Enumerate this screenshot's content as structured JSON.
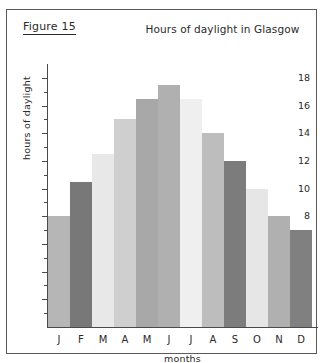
{
  "figure": {
    "label": "Figure 15"
  },
  "chart_data": {
    "type": "bar",
    "title": "Hours of daylight in Glasgow",
    "xlabel": "months",
    "ylabel": "hours of daylight",
    "categories": [
      "J",
      "F",
      "M",
      "A",
      "M",
      "J",
      "J",
      "A",
      "S",
      "O",
      "N",
      "D"
    ],
    "values": [
      8,
      10.5,
      12.5,
      15,
      16.5,
      17.5,
      16.5,
      14,
      12,
      10,
      8,
      7
    ],
    "bar_colors": [
      "#b6b6b6",
      "#787878",
      "#e8e8e8",
      "#cfcfcf",
      "#a8a8a8",
      "#b0b0b0",
      "#efefef",
      "#bdbdbd",
      "#7c7c7c",
      "#e6e6e6",
      "#b0b0b0",
      "#808080"
    ],
    "ylim": [
      0,
      19
    ],
    "y_major_ticks": [
      2,
      4,
      6,
      8,
      10,
      12,
      14,
      16,
      18
    ],
    "y_minor_ticks": [
      1,
      3,
      5,
      7,
      9,
      11,
      13,
      15,
      17
    ],
    "grid": false,
    "legend": "none"
  }
}
